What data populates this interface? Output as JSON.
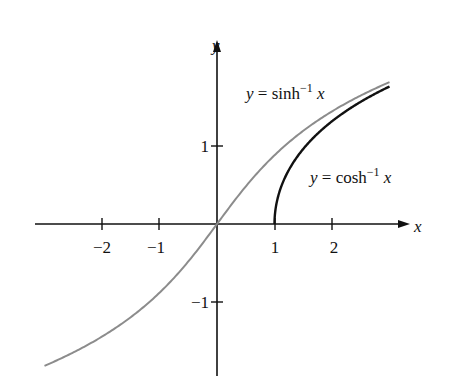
{
  "chart_data": {
    "type": "line",
    "title": "",
    "xlabel": "x",
    "ylabel": "y",
    "xlim": [
      -3.1,
      3.4
    ],
    "ylim": [
      -2.0,
      2.4
    ],
    "x_ticks": [
      -2,
      -1,
      1,
      2
    ],
    "x_tick_labels": [
      "−2",
      "−1",
      "1",
      "2"
    ],
    "y_ticks": [
      1,
      -1
    ],
    "y_tick_labels": [
      "1",
      "−1"
    ],
    "grid": false,
    "legend": "none (inline curve labels)",
    "series": [
      {
        "name": "y = sinh⁻¹ x",
        "function": "asinh",
        "color": "#8c8c8c",
        "x_range": [
          -3.0,
          3.0
        ],
        "x": [
          -3,
          -2,
          -1,
          0,
          1,
          2,
          3
        ],
        "values": [
          -1.82,
          -1.44,
          -0.88,
          0,
          0.88,
          1.44,
          1.82
        ]
      },
      {
        "name": "y = cosh⁻¹ x",
        "function": "acosh",
        "color": "#111111",
        "x_range": [
          1.0,
          3.0
        ],
        "x": [
          1,
          1.5,
          2,
          2.5,
          3
        ],
        "values": [
          0,
          0.96,
          1.32,
          1.57,
          1.76
        ]
      }
    ],
    "annotations": [
      {
        "text": "y = sinh⁻¹ x",
        "near": "upper middle"
      },
      {
        "text": "y = cosh⁻¹ x",
        "near": "right of black curve"
      }
    ]
  },
  "labels": {
    "x_axis": "x",
    "y_axis": "y",
    "sinh_y": "y",
    "sinh_eq": " = sinh",
    "sinh_sup": "−1",
    "sinh_x": " x",
    "cosh_y": "y",
    "cosh_eq": " = cosh",
    "cosh_sup": "−1",
    "cosh_x": " x",
    "xt_m2": "−2",
    "xt_m1": "−1",
    "xt_1": "1",
    "xt_2": "2",
    "yt_1": "1",
    "yt_m1": "−1"
  }
}
